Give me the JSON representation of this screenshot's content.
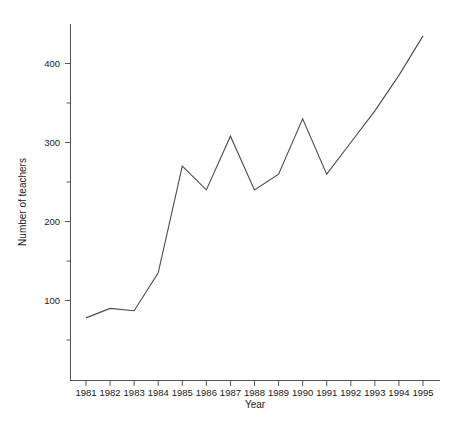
{
  "chart_data": {
    "type": "line",
    "title": "",
    "xlabel": "Year",
    "ylabel": "Number of teachers",
    "categories": [
      "1981",
      "1982",
      "1983",
      "1984",
      "1985",
      "1986",
      "1987",
      "1988",
      "1989",
      "1990",
      "1991",
      "1992",
      "1993",
      "1994",
      "1995"
    ],
    "x": [
      1981,
      1982,
      1983,
      1984,
      1985,
      1986,
      1987,
      1988,
      1989,
      1990,
      1991,
      1992,
      1993,
      1994,
      1995
    ],
    "values": [
      78,
      90,
      87,
      135,
      270,
      240,
      308,
      240,
      260,
      330,
      260,
      300,
      340,
      385,
      435
    ],
    "series": [
      {
        "name": "Number of teachers",
        "values": [
          78,
          90,
          87,
          135,
          270,
          240,
          308,
          240,
          260,
          330,
          260,
          300,
          340,
          385,
          435
        ]
      }
    ],
    "ylim": [
      40,
      450
    ],
    "xlim": [
      1981,
      1995
    ],
    "y_ticks_major": [
      100,
      200,
      300,
      400
    ],
    "y_tick_labels": [
      "100",
      "200",
      "300",
      "400"
    ],
    "y_ticks_minor": [
      150,
      250,
      350
    ],
    "grid": false,
    "legend": "none",
    "line_color": "#4a4a52",
    "axis_color": "#555555",
    "background_color": "#ffffff"
  },
  "axes": {
    "y_title": "Number of teachers",
    "x_title": "Year"
  }
}
